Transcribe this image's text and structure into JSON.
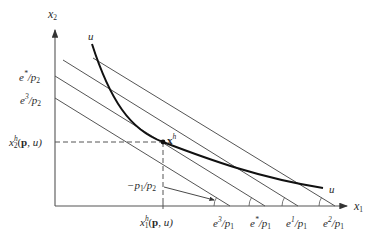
{
  "figure": {
    "axes": {
      "x_label": "x",
      "x_label_sub": "1",
      "y_label": "x",
      "y_label_sub": "2"
    },
    "y_intercepts": [
      {
        "numerator": "e",
        "sup": "*",
        "denominator": "/p",
        "den_sub": "2"
      },
      {
        "numerator": "e",
        "sup": "3",
        "denominator": "/p",
        "den_sub": "2"
      }
    ],
    "x_intercepts": [
      {
        "numerator": "e",
        "sup": "3",
        "denominator": "/p",
        "den_sub": "1"
      },
      {
        "numerator": "e",
        "sup": "*",
        "denominator": "/p",
        "den_sub": "1"
      },
      {
        "numerator": "e",
        "sup": "1",
        "denominator": "/p",
        "den_sub": "1"
      },
      {
        "numerator": "e",
        "sup": "2",
        "denominator": "/p",
        "den_sub": "1"
      }
    ],
    "hicksian_x2": {
      "base": "x",
      "sup": "h",
      "sub": "2",
      "args_open": "(",
      "bold": "p",
      "args_close": ", u)"
    },
    "hicksian_x1": {
      "base": "x",
      "sup": "h",
      "sub": "1",
      "args_open": "(",
      "bold": "p",
      "args_close": ", u)"
    },
    "point_label": {
      "bold": "x",
      "sup": "h"
    },
    "slope_label": {
      "text": "−p",
      "sub1": "1",
      "mid": "/p",
      "sub2": "2"
    },
    "curve_label_top": "u",
    "curve_label_bottom": "u",
    "colors": {
      "line": "#555555",
      "curve": "#111111",
      "axis": "#555555"
    }
  }
}
